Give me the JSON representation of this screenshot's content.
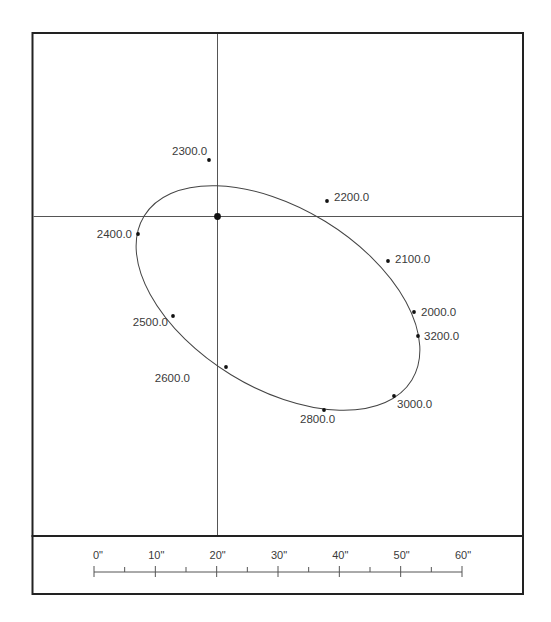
{
  "diagram": {
    "type": "orbit-plot",
    "frame": {
      "left": 32,
      "top": 33,
      "right": 523,
      "divider_y": 536,
      "bottom": 594
    },
    "colors": {
      "frame": "#222222",
      "lines": "#555555",
      "ellipse": "#444444",
      "points": "#111111",
      "text": "#3a3a3a"
    },
    "crosshair": {
      "x": 217,
      "y": 216
    },
    "ellipse": {
      "cx": 278,
      "cy": 298,
      "rx": 157,
      "ry": 90,
      "rotation_deg": 31.5
    },
    "points": [
      {
        "label": "2300.0",
        "x": 209,
        "y": 160,
        "lx": 172,
        "ly": 155,
        "anchor": "start"
      },
      {
        "label": "2200.0",
        "x": 327,
        "y": 201,
        "lx": 334,
        "ly": 201,
        "anchor": "start"
      },
      {
        "label": "2400.0",
        "x": 138,
        "y": 234,
        "lx": 132,
        "ly": 238,
        "anchor": "end"
      },
      {
        "label": "2100.0",
        "x": 388,
        "y": 261,
        "lx": 395,
        "ly": 263,
        "anchor": "start"
      },
      {
        "label": "2000.0",
        "x": 414,
        "y": 312,
        "lx": 421,
        "ly": 316,
        "anchor": "start"
      },
      {
        "label": "3200.0",
        "x": 418,
        "y": 336,
        "lx": 424,
        "ly": 340,
        "anchor": "start"
      },
      {
        "label": "2500.0",
        "x": 173,
        "y": 316,
        "lx": 168,
        "ly": 326,
        "anchor": "end"
      },
      {
        "label": "2600.0",
        "x": 226,
        "y": 367,
        "lx": 225,
        "ly": 320,
        "anchor": "end",
        "ly_override": 320
      },
      {
        "label": "2800.0",
        "x": 324,
        "y": 410,
        "lx": 300,
        "ly": 423,
        "anchor": "start"
      },
      {
        "label": "3000.0",
        "x": 394,
        "y": 396,
        "lx": 397,
        "ly": 408,
        "anchor": "start"
      }
    ]
  },
  "scale_bar": {
    "x0": 94,
    "x1": 462,
    "y": 572,
    "labels": [
      "0\"",
      "10\"",
      "20\"",
      "30\"",
      "40\"",
      "50\"",
      "60\""
    ],
    "major_ticks": 7,
    "minor_between": true
  }
}
